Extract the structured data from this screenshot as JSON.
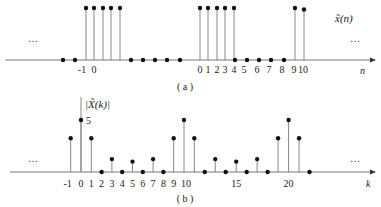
{
  "chart_data": [
    {
      "type": "stem",
      "title": "(a)",
      "series_label": "x̃(n)",
      "xlabel": "n",
      "ylabel": "",
      "ellipsis_left": "…",
      "ellipsis_right": "…",
      "tick_labels": [
        "-1",
        "0",
        "0",
        "1",
        "2",
        "3",
        "4",
        "5",
        "6",
        "7",
        "8",
        "9",
        "10"
      ],
      "points": [
        {
          "x": 63,
          "v": 0
        },
        {
          "x": 75,
          "v": 0
        },
        {
          "x": 86,
          "v": 1
        },
        {
          "x": 94,
          "v": 1
        },
        {
          "x": 103,
          "v": 1
        },
        {
          "x": 111,
          "v": 1
        },
        {
          "x": 120,
          "v": 1
        },
        {
          "x": 131,
          "v": 0
        },
        {
          "x": 143,
          "v": 0
        },
        {
          "x": 155,
          "v": 0
        },
        {
          "x": 167,
          "v": 0
        },
        {
          "x": 180,
          "v": 0
        },
        {
          "x": 200,
          "v": 1
        },
        {
          "x": 208,
          "v": 1
        },
        {
          "x": 217,
          "v": 1
        },
        {
          "x": 225,
          "v": 1
        },
        {
          "x": 234,
          "v": 1
        },
        {
          "x": 235,
          "v": 0
        },
        {
          "x": 247,
          "v": 0
        },
        {
          "x": 259,
          "v": 0
        },
        {
          "x": 271,
          "v": 0
        },
        {
          "x": 284,
          "v": 0
        },
        {
          "x": 295,
          "v": 1
        },
        {
          "x": 304,
          "v": 0.97
        }
      ],
      "description": "Periodic rectangular sequence with period N=10: five samples of value 1 (n=0..4), five zero samples (n=5..9), repeating."
    },
    {
      "type": "stem",
      "title": "(b)",
      "series_label": "|X̃(k)|",
      "xlabel": "k",
      "annotation": "5",
      "ellipsis_left": "…",
      "ellipsis_right": "…",
      "categories": [
        -1,
        0,
        1,
        2,
        3,
        4,
        5,
        6,
        7,
        8,
        9,
        10,
        11,
        12,
        13,
        14,
        15,
        16,
        17,
        18,
        19,
        20,
        21,
        22
      ],
      "values": [
        3.24,
        5,
        3.24,
        0,
        1.24,
        0,
        1,
        0,
        1.24,
        0,
        3.24,
        5,
        3.24,
        0,
        1.24,
        0,
        1,
        0,
        1.24,
        0,
        3.24,
        5,
        3.24,
        0
      ],
      "tick_labels": [
        "-1",
        "0",
        "1",
        "2",
        "3",
        "4",
        "5",
        "6",
        "7",
        "8",
        "9",
        "10",
        "15",
        "20"
      ],
      "ylim": [
        0,
        5
      ]
    }
  ],
  "labels": {
    "a_caption": "( a )",
    "b_caption": "( b )",
    "a_series": "x̃(n)",
    "b_series": "|X̃(k)|",
    "n_axis": "n",
    "k_axis": "k",
    "five": "5",
    "dots": "…"
  }
}
